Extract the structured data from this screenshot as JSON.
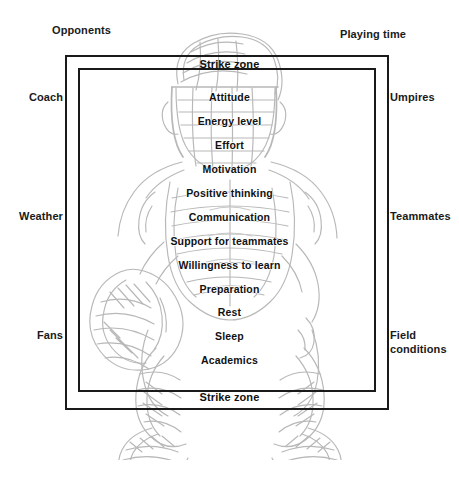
{
  "figure": {
    "type": "concept-diagram",
    "illustration": "baseball-catcher-crouching-line-art"
  },
  "zone": {
    "top_label": "Strike zone",
    "bottom_label": "Strike zone"
  },
  "inner_items": [
    "Attitude",
    "Energy level",
    "Effort",
    "Motivation",
    "Positive thinking",
    "Communication",
    "Support for teammates",
    "Willingness to learn",
    "Preparation",
    "Rest",
    "Sleep",
    "Academics"
  ],
  "external_factors": {
    "top_left": "Opponents",
    "top_right": "Playing time",
    "left": [
      "Coach",
      "Weather",
      "Fans"
    ],
    "right": [
      "Umpires",
      "Teammates",
      "Field\nconditions"
    ]
  },
  "colors": {
    "ink": "#1a1a1a",
    "text": "#111111",
    "artwork": "#8a8a8a",
    "background": "#ffffff"
  }
}
